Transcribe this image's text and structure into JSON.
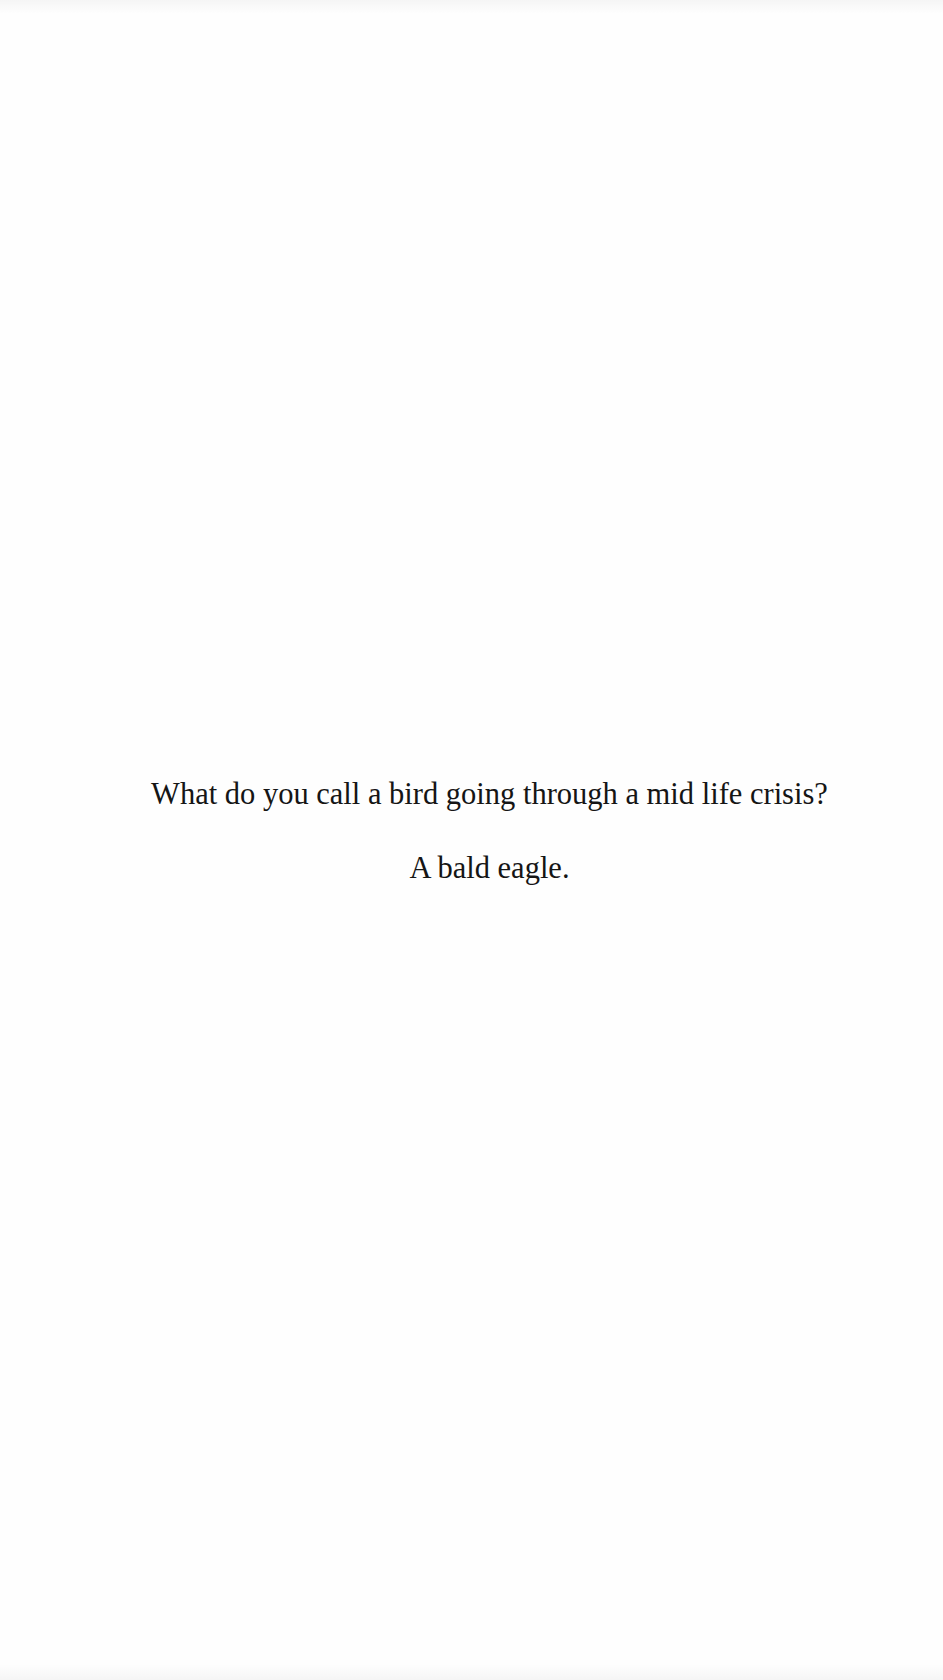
{
  "document": {
    "joke": {
      "question": "What do you call a bird going through a mid life crisis?",
      "answer": "A bald eagle."
    },
    "colors": {
      "background": "#fefefe",
      "text": "#151515"
    }
  }
}
